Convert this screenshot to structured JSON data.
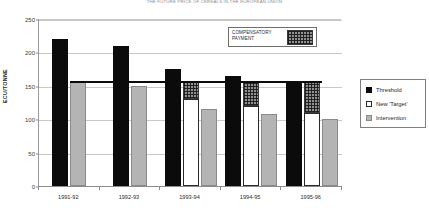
{
  "chart_data": {
    "type": "bar",
    "title": "THE FUTURE PRICE OF CEREALS IN THE EUROPEAN UNION",
    "xlabel": "",
    "ylabel": "ECU/TONNE",
    "ylim": [
      0,
      250
    ],
    "ytick_values": [
      0,
      50,
      100,
      150,
      200,
      250
    ],
    "ytick_labels": [
      "0",
      "50",
      "100",
      "150",
      "200",
      "250"
    ],
    "grid": true,
    "legend_position": "right",
    "categories": [
      "1991-92",
      "1992-93",
      "1993-94",
      "1994-95",
      "1995-96"
    ],
    "series": [
      {
        "name": "Threshold",
        "key": "threshold",
        "color": "#0b0b0b",
        "values": [
          220,
          210,
          175,
          165,
          155
        ]
      },
      {
        "name": "New 'Target'",
        "key": "target",
        "color": "#ffffff",
        "values": [
          null,
          null,
          130,
          120,
          110
        ]
      },
      {
        "name": "Intervention",
        "key": "intervention",
        "color": "#b4b4b4",
        "values": [
          155,
          150,
          115,
          108,
          100
        ]
      }
    ],
    "compensatory_payment": {
      "label": "COMPENSATORY PAYMENT",
      "description": "Hatched area above the New 'Target' bar up to the target price line",
      "values": [
        null,
        null,
        25,
        35,
        45
      ],
      "top_value": 155
    },
    "reference_line": {
      "label": "Target price line",
      "value": 155,
      "color": "#0b0b0b"
    }
  },
  "title": {
    "text": "THE FUTURE PRICE OF CEREALS IN THE EUROPEAN UNION"
  },
  "axes": {
    "y_title": "ECU/TONNE",
    "y_ticks": [
      "250",
      "200",
      "150",
      "100",
      "50",
      "0"
    ],
    "x_ticks": [
      "1991-92",
      "1992-93",
      "1993-94",
      "1994-95",
      "1995-96"
    ]
  },
  "callout": {
    "line1": "COMPENSATORY",
    "line2": "PAYMENT"
  },
  "legend": {
    "items": [
      {
        "label": "Threshold",
        "swatch": "threshold"
      },
      {
        "label": "New 'Target'",
        "swatch": "target"
      },
      {
        "label": "Intervention",
        "swatch": "intervention"
      }
    ]
  }
}
